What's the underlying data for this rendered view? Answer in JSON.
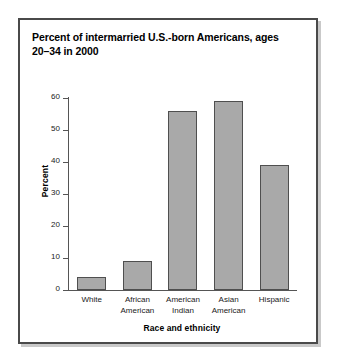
{
  "chart_data": {
    "type": "bar",
    "title": "Percent of intermarried U.S.-born Americans, ages 20–34 in 2000",
    "title_line1": "Percent of intermarried U.S.-born Americans, ages",
    "title_line2": "20–34 in 2000",
    "categories": [
      "White",
      "African American",
      "American Indian",
      "Asian American",
      "Hispanic"
    ],
    "category_lines": [
      [
        "White"
      ],
      [
        "African",
        "American"
      ],
      [
        "American",
        "Indian"
      ],
      [
        "Asian",
        "American"
      ],
      [
        "Hispanic"
      ]
    ],
    "values": [
      4,
      9,
      56,
      59,
      39
    ],
    "xlabel": "Race and ethnicity",
    "ylabel": "Percent",
    "ylim": [
      0,
      60
    ],
    "yticks": [
      0,
      10,
      20,
      30,
      40,
      50,
      60
    ],
    "grid": false,
    "legend": false,
    "bar_color": "#a9a9a9",
    "bar_border_color": "#4f4f4f",
    "axis_color": "#555555",
    "frame_color": "#4a4a4a",
    "background": "#ffffff"
  }
}
